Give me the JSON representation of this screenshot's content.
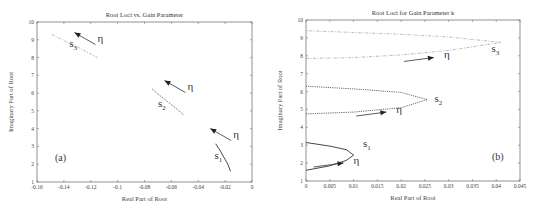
{
  "chart_data": [
    {
      "type": "line",
      "title": "Root Loci vs. Gain Parameter",
      "xlabel": "Real Part of Root",
      "ylabel": "Imaginary Part of Root",
      "xlim": [
        -0.16,
        0
      ],
      "ylim": [
        1,
        10
      ],
      "xticks": [
        "-0.16",
        "-0.14",
        "-0.12",
        "-0.1",
        "-0.08",
        "-0.06",
        "-0.04",
        "-0.02",
        "0"
      ],
      "yticks": [
        "1",
        "2",
        "3",
        "4",
        "5",
        "6",
        "7",
        "8",
        "9",
        "10"
      ],
      "panel_label": "(a)",
      "grid": false,
      "series": [
        {
          "name": "s1",
          "style": "solid",
          "x": [
            -0.027,
            -0.024,
            -0.021,
            -0.018,
            -0.016
          ],
          "y": [
            3.15,
            2.8,
            2.4,
            2.0,
            1.6
          ]
        },
        {
          "name": "s2",
          "style": "dotted",
          "x": [
            -0.0745,
            -0.07,
            -0.065,
            -0.06,
            -0.055,
            -0.0505
          ],
          "y": [
            6.25,
            5.95,
            5.65,
            5.35,
            5.05,
            4.75
          ]
        },
        {
          "name": "s3",
          "style": "dash-dot light",
          "x": [
            -0.149,
            -0.14,
            -0.13,
            -0.12,
            -0.115
          ],
          "y": [
            9.3,
            8.95,
            8.6,
            8.2,
            8.0
          ]
        }
      ],
      "annotations": [
        {
          "text": "s1",
          "x": -0.028,
          "y": 2.3
        },
        {
          "text": "s2",
          "x": -0.07,
          "y": 5.2
        },
        {
          "text": "s3",
          "x": -0.136,
          "y": 8.6
        },
        {
          "text": "η",
          "x": -0.014,
          "y": 3.5,
          "arrow": "up-left"
        },
        {
          "text": "η",
          "x": -0.048,
          "y": 6.2,
          "arrow": "up-left"
        },
        {
          "text": "η",
          "x": -0.115,
          "y": 8.9,
          "arrow": "up-left"
        }
      ]
    },
    {
      "type": "line",
      "title": "Root Loci for Gain Parameter k",
      "xlabel": "Real Part of Root",
      "ylabel": "Imaginary Part of Root",
      "xlim": [
        0,
        0.045
      ],
      "ylim": [
        1,
        10
      ],
      "xticks": [
        "0",
        "0.005",
        "0.01",
        "0.015",
        "0.02",
        "0.025",
        "0.03",
        "0.035",
        "0.04",
        "0.045"
      ],
      "yticks": [
        "1",
        "2",
        "3",
        "4",
        "5",
        "6",
        "7",
        "8",
        "9",
        "10"
      ],
      "panel_label": "(b)",
      "grid": false,
      "series": [
        {
          "name": "s1",
          "style": "solid",
          "x": [
            0,
            0.005,
            0.0085,
            0.01,
            0.0085,
            0.005,
            0
          ],
          "y": [
            1.6,
            1.85,
            2.15,
            2.45,
            2.75,
            2.95,
            3.15
          ]
        },
        {
          "name": "s2",
          "style": "dotted",
          "x": [
            0,
            0.01,
            0.02,
            0.0255,
            0.02,
            0.01,
            0
          ],
          "y": [
            4.75,
            4.85,
            5.1,
            5.55,
            5.95,
            6.15,
            6.3
          ]
        },
        {
          "name": "s3",
          "style": "dash-dot light",
          "x": [
            0,
            0.01,
            0.02,
            0.03,
            0.041,
            0.03,
            0.02,
            0.01,
            0
          ],
          "y": [
            7.85,
            7.9,
            8.05,
            8.3,
            8.75,
            9.05,
            9.2,
            9.3,
            9.4
          ]
        }
      ],
      "annotations": [
        {
          "text": "s1",
          "x": 0.012,
          "y": 2.9
        },
        {
          "text": "s2",
          "x": 0.027,
          "y": 5.4
        },
        {
          "text": "s3",
          "x": 0.039,
          "y": 8.2
        },
        {
          "text": "η",
          "x": 0.01,
          "y": 1.95,
          "arrow": "right"
        },
        {
          "text": "η",
          "x": 0.019,
          "y": 4.8,
          "arrow": "right"
        },
        {
          "text": "η",
          "x": 0.029,
          "y": 7.85,
          "arrow": "right"
        }
      ]
    }
  ]
}
